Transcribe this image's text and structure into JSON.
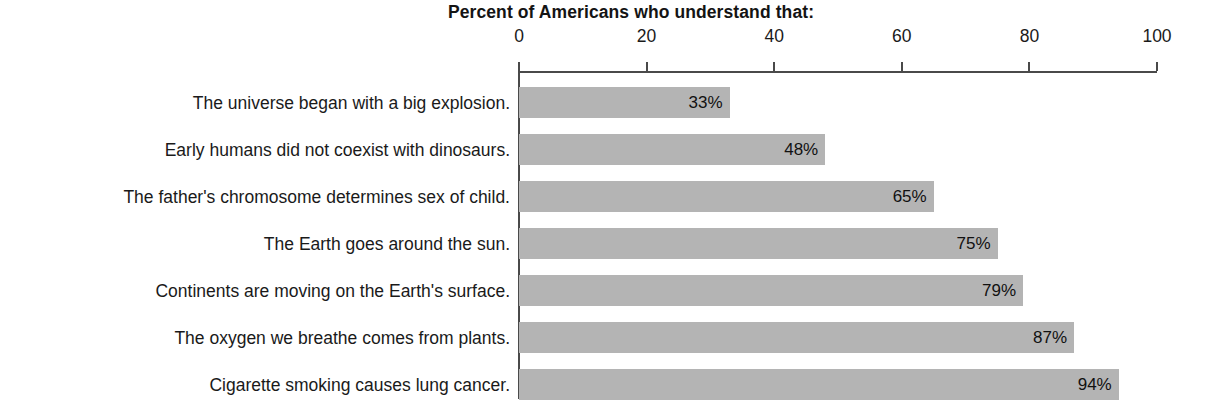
{
  "chart_data": {
    "type": "bar",
    "orientation": "horizontal",
    "title": "Percent of Americans who understand that:",
    "xlabel": "",
    "ylabel": "",
    "xlim": [
      0,
      100
    ],
    "xticks": [
      "0",
      "20",
      "40",
      "60",
      "80",
      "100"
    ],
    "grid": false,
    "legend": null,
    "bar_color": "#b4b4b4",
    "axis_color": "#4a4a4a",
    "categories": [
      "The universe began with a big explosion.",
      "Early humans did not coexist with dinosaurs.",
      "The father's chromosome determines sex of child.",
      "The Earth goes around the sun.",
      "Continents are moving on the Earth's surface.",
      "The oxygen we breathe comes from plants.",
      "Cigarette smoking causes lung cancer."
    ],
    "values": [
      33,
      48,
      65,
      75,
      79,
      87,
      94
    ],
    "value_labels": [
      "33%",
      "48%",
      "65%",
      "75%",
      "79%",
      "87%",
      "94%"
    ]
  }
}
